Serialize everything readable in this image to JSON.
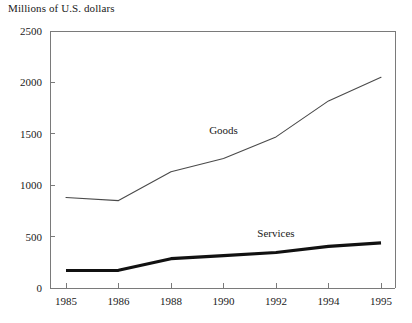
{
  "chart_data": {
    "type": "line",
    "title": "Millions of U.S. dollars",
    "xlabel": "",
    "ylabel": "",
    "categories": [
      "1985",
      "1986",
      "1988",
      "1990",
      "1992",
      "1994",
      "1995"
    ],
    "yticks": [
      0,
      500,
      1000,
      1500,
      2000,
      2500
    ],
    "ytick_labels": [
      "0",
      "500",
      "1000",
      "1500",
      "2000",
      "2500"
    ],
    "ylim": [
      0,
      2500
    ],
    "grid": false,
    "legend_position": "inline-annotation",
    "series": [
      {
        "name": "Goods",
        "values": [
          880,
          850,
          1130,
          1260,
          1470,
          1820,
          2050
        ],
        "color": "#4a4a4a",
        "line_width": "thin",
        "annotation": "Goods"
      },
      {
        "name": "Services",
        "values": [
          170,
          172,
          285,
          315,
          345,
          405,
          440
        ],
        "color": "#111111",
        "line_width": "thick",
        "annotation": "Services"
      }
    ],
    "annotations": [
      {
        "text": "Goods",
        "category": "1990",
        "value": 1500
      },
      {
        "text": "Services",
        "category": "1992",
        "value": 500
      }
    ]
  },
  "axes": {
    "y_axis_title": "Millions of U.S. dollars"
  }
}
